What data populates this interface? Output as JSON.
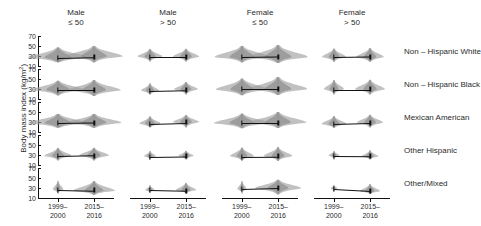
{
  "chart_data": {
    "type": "violin",
    "title": "",
    "ylabel": "Body mass index (kg/m",
    "ylabel_sup": "2",
    "ylabel_suffix": ")",
    "ylim": [
      10,
      70
    ],
    "yticks": [
      70,
      50,
      30,
      10
    ],
    "grid": false,
    "legend": "none",
    "x": [
      "1999-2000",
      "2015-2016"
    ],
    "xtick_labels": [
      {
        "l1": "1999–",
        "l2": "2000"
      },
      {
        "l1": "2015–",
        "l2": "2016"
      }
    ],
    "columns": [
      {
        "l1": "Male",
        "l2": "≤ 50",
        "sex": "Male",
        "age": "≤ 50"
      },
      {
        "l1": "Male",
        "l2": "> 50",
        "sex": "Male",
        "age": "> 50"
      },
      {
        "l1": "Female",
        "l2": "≤ 50",
        "sex": "Female",
        "age": "≤ 50"
      },
      {
        "l1": "Female",
        "l2": "> 50",
        "sex": "Female",
        "age": "> 50"
      }
    ],
    "rows": [
      {
        "label": "Non – Hispanic White"
      },
      {
        "label": "Non – Hispanic Black"
      },
      {
        "label": "Mexican American"
      },
      {
        "label": "Other Hispanic"
      },
      {
        "label": "Other/Mixed"
      }
    ],
    "panels": [
      {
        "row": "Non – Hispanic White",
        "col": "Male ≤ 50",
        "points": [
          {
            "x": "1999–2000",
            "median": 27.0,
            "spread": 1.0,
            "lo": 17,
            "hi": 48
          },
          {
            "x": "2015–2016",
            "median": 28.6,
            "spread": 0.96,
            "lo": 17,
            "hi": 50
          }
        ]
      },
      {
        "row": "Non – Hispanic White",
        "col": "Male > 50",
        "points": [
          {
            "x": "1999–2000",
            "median": 28.2,
            "spread": 0.42,
            "lo": 19,
            "hi": 44
          },
          {
            "x": "2015–2016",
            "median": 28.4,
            "spread": 0.44,
            "lo": 19,
            "hi": 45
          }
        ]
      },
      {
        "row": "Non – Hispanic White",
        "col": "Female ≤ 50",
        "points": [
          {
            "x": "1999–2000",
            "median": 27.2,
            "spread": 0.92,
            "lo": 17,
            "hi": 50
          },
          {
            "x": "2015–2016",
            "median": 28.4,
            "spread": 1.0,
            "lo": 17,
            "hi": 53
          }
        ]
      },
      {
        "row": "Non – Hispanic White",
        "col": "Female > 50",
        "points": [
          {
            "x": "1999–2000",
            "median": 27.4,
            "spread": 0.4,
            "lo": 18,
            "hi": 45
          },
          {
            "x": "2015–2016",
            "median": 28.2,
            "spread": 0.46,
            "lo": 18,
            "hi": 47
          }
        ]
      },
      {
        "row": "Non – Hispanic Black",
        "col": "Male ≤ 50",
        "points": [
          {
            "x": "1999–2000",
            "median": 28.0,
            "spread": 0.88,
            "lo": 17,
            "hi": 47
          },
          {
            "x": "2015–2016",
            "median": 28.2,
            "spread": 0.9,
            "lo": 17,
            "hi": 49
          }
        ]
      },
      {
        "row": "Non – Hispanic Black",
        "col": "Male > 50",
        "points": [
          {
            "x": "1999–2000",
            "median": 27.0,
            "spread": 0.3,
            "lo": 19,
            "hi": 42
          },
          {
            "x": "2015–2016",
            "median": 28.6,
            "spread": 0.4,
            "lo": 19,
            "hi": 44
          }
        ]
      },
      {
        "row": "Non – Hispanic Black",
        "col": "Female ≤ 50",
        "points": [
          {
            "x": "1999–2000",
            "median": 29.6,
            "spread": 0.88,
            "lo": 18,
            "hi": 52
          },
          {
            "x": "2015–2016",
            "median": 29.4,
            "spread": 0.98,
            "lo": 18,
            "hi": 54
          }
        ]
      },
      {
        "row": "Non – Hispanic Black",
        "col": "Female > 50",
        "points": [
          {
            "x": "1999–2000",
            "median": 29.0,
            "spread": 0.34,
            "lo": 19,
            "hi": 48
          },
          {
            "x": "2015–2016",
            "median": 29.2,
            "spread": 0.5,
            "lo": 19,
            "hi": 49
          }
        ]
      },
      {
        "row": "Mexican American",
        "col": "Male ≤ 50",
        "points": [
          {
            "x": "1999–2000",
            "median": 28.0,
            "spread": 1.0,
            "lo": 18,
            "hi": 47
          },
          {
            "x": "2015–2016",
            "median": 28.8,
            "spread": 0.92,
            "lo": 18,
            "hi": 47
          }
        ]
      },
      {
        "row": "Mexican American",
        "col": "Male > 50",
        "points": [
          {
            "x": "1999–2000",
            "median": 27.0,
            "spread": 0.36,
            "lo": 19,
            "hi": 42
          },
          {
            "x": "2015–2016",
            "median": 29.2,
            "spread": 0.44,
            "lo": 19,
            "hi": 44
          }
        ]
      },
      {
        "row": "Mexican American",
        "col": "Female ≤ 50",
        "points": [
          {
            "x": "1999–2000",
            "median": 28.4,
            "spread": 0.94,
            "lo": 18,
            "hi": 48
          },
          {
            "x": "2015–2016",
            "median": 28.6,
            "spread": 0.96,
            "lo": 18,
            "hi": 50
          }
        ]
      },
      {
        "row": "Mexican American",
        "col": "Female > 50",
        "points": [
          {
            "x": "1999–2000",
            "median": 26.8,
            "spread": 0.42,
            "lo": 19,
            "hi": 43
          },
          {
            "x": "2015–2016",
            "median": 28.6,
            "spread": 0.44,
            "lo": 19,
            "hi": 45
          }
        ]
      },
      {
        "row": "Other Hispanic",
        "col": "Male ≤ 50",
        "points": [
          {
            "x": "1999–2000",
            "median": 27.4,
            "spread": 0.46,
            "lo": 19,
            "hi": 44
          },
          {
            "x": "2015–2016",
            "median": 28.8,
            "spread": 0.5,
            "lo": 19,
            "hi": 45
          }
        ]
      },
      {
        "row": "Other Hispanic",
        "col": "Male > 50",
        "points": [
          {
            "x": "1999–2000",
            "median": 26.8,
            "spread": 0.2,
            "lo": 21,
            "hi": 38
          },
          {
            "x": "2015–2016",
            "median": 28.0,
            "spread": 0.26,
            "lo": 21,
            "hi": 39
          }
        ]
      },
      {
        "row": "Other Hispanic",
        "col": "Female ≤ 50",
        "points": [
          {
            "x": "1999–2000",
            "median": 27.0,
            "spread": 0.4,
            "lo": 18,
            "hi": 45
          },
          {
            "x": "2015–2016",
            "median": 27.6,
            "spread": 0.48,
            "lo": 18,
            "hi": 46
          }
        ]
      },
      {
        "row": "Other Hispanic",
        "col": "Female > 50",
        "points": [
          {
            "x": "1999–2000",
            "median": 28.2,
            "spread": 0.18,
            "lo": 21,
            "hi": 38
          },
          {
            "x": "2015–2016",
            "median": 27.6,
            "spread": 0.28,
            "lo": 21,
            "hi": 40
          }
        ]
      },
      {
        "row": "Other/Mixed",
        "col": "Male ≤ 50",
        "points": [
          {
            "x": "1999–2000",
            "median": 26.8,
            "spread": 0.18,
            "lo": 19,
            "hi": 45
          },
          {
            "x": "2015–2016",
            "median": 25.2,
            "spread": 0.7,
            "lo": 17,
            "hi": 45
          }
        ]
      },
      {
        "row": "Other/Mixed",
        "col": "Male > 50",
        "points": [
          {
            "x": "1999–2000",
            "median": 26.6,
            "spread": 0.16,
            "lo": 21,
            "hi": 37
          },
          {
            "x": "2015–2016",
            "median": 25.0,
            "spread": 0.34,
            "lo": 19,
            "hi": 40
          }
        ]
      },
      {
        "row": "Other/Mixed",
        "col": "Female ≤ 50",
        "points": [
          {
            "x": "1999–2000",
            "median": 27.2,
            "spread": 0.16,
            "lo": 19,
            "hi": 44
          },
          {
            "x": "2015–2016",
            "median": 29.2,
            "spread": 0.78,
            "lo": 17,
            "hi": 47
          }
        ]
      },
      {
        "row": "Other/Mixed",
        "col": "Female > 50",
        "points": [
          {
            "x": "1999–2000",
            "median": 28.2,
            "spread": 0.12,
            "lo": 23,
            "hi": 36
          },
          {
            "x": "2015–2016",
            "median": 24.4,
            "spread": 0.34,
            "lo": 19,
            "hi": 39
          }
        ]
      }
    ],
    "colors": {
      "violin_fill": "#9b9b9b",
      "violin_fill_light": "#b4b4b4",
      "line": "#111111",
      "axis": "#111111",
      "text": "#2b2b2b"
    }
  }
}
